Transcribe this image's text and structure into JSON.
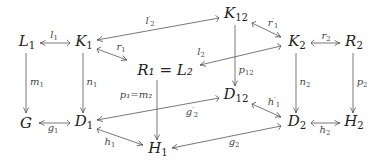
{
  "diagram": {
    "type": "commutative-diagram",
    "nodes": [
      {
        "id": "L1",
        "base": "L",
        "sub": "1",
        "x": 27,
        "y": 43
      },
      {
        "id": "K1",
        "base": "K",
        "sub": "1",
        "x": 83,
        "y": 43
      },
      {
        "id": "R1L2",
        "text": "R₁ = L₂",
        "x": 165,
        "y": 70
      },
      {
        "id": "K12",
        "base": "K",
        "sub": "12",
        "x": 235,
        "y": 15
      },
      {
        "id": "K2",
        "base": "K",
        "sub": "2",
        "x": 296,
        "y": 43
      },
      {
        "id": "R2",
        "base": "R",
        "sub": "2",
        "x": 353,
        "y": 43
      },
      {
        "id": "G",
        "base": "G",
        "sub": "",
        "x": 26,
        "y": 123
      },
      {
        "id": "D1",
        "base": "D",
        "sub": "1",
        "x": 83,
        "y": 123
      },
      {
        "id": "D12",
        "base": "D",
        "sub": "12",
        "x": 235,
        "y": 96
      },
      {
        "id": "D2",
        "base": "D",
        "sub": "2",
        "x": 296,
        "y": 123
      },
      {
        "id": "H2",
        "base": "H",
        "sub": "2",
        "x": 353,
        "y": 123
      },
      {
        "id": "H1",
        "base": "H",
        "sub": "1",
        "x": 158,
        "y": 150
      }
    ],
    "labels": {
      "l1": {
        "base": "l",
        "sub": "1",
        "prime": ""
      },
      "r1": {
        "base": "r",
        "sub": "1",
        "prime": ""
      },
      "l2p": {
        "base": "l",
        "sub": "2",
        "prime": "′"
      },
      "r1p": {
        "base": "r",
        "sub": "1",
        "prime": "′"
      },
      "l2": {
        "base": "l",
        "sub": "2",
        "prime": ""
      },
      "r2": {
        "base": "r",
        "sub": "2",
        "prime": ""
      },
      "m1": {
        "base": "m",
        "sub": "1",
        "prime": ""
      },
      "n1": {
        "base": "n",
        "sub": "1",
        "prime": ""
      },
      "p12": {
        "base": "p",
        "sub": "12",
        "prime": ""
      },
      "n2": {
        "base": "n",
        "sub": "2",
        "prime": ""
      },
      "p2": {
        "base": "p",
        "sub": "2",
        "prime": ""
      },
      "p1m2": {
        "text": "p₁=m₂"
      },
      "g1": {
        "base": "g",
        "sub": "1",
        "prime": ""
      },
      "g2p": {
        "base": "g",
        "sub": "2",
        "prime": "′"
      },
      "h1p": {
        "base": "h",
        "sub": "1",
        "prime": "′"
      },
      "h2": {
        "base": "h",
        "sub": "2",
        "prime": ""
      },
      "h1": {
        "base": "h",
        "sub": "1",
        "prime": ""
      },
      "g2": {
        "base": "g",
        "sub": "2",
        "prime": ""
      }
    },
    "node_text": {
      "L1": {
        "base": "L",
        "sub": "1"
      },
      "K1": {
        "base": "K",
        "sub": "1"
      },
      "R1L2": {
        "text": "R₁ = L₂"
      },
      "K12": {
        "base": "K",
        "sub": "12"
      },
      "K2": {
        "base": "K",
        "sub": "2"
      },
      "R2": {
        "base": "R",
        "sub": "2"
      },
      "G": {
        "base": "G",
        "sub": ""
      },
      "D1": {
        "base": "D",
        "sub": "1"
      },
      "D12": {
        "base": "D",
        "sub": "12"
      },
      "D2": {
        "base": "D",
        "sub": "2"
      },
      "H2": {
        "base": "H",
        "sub": "2"
      },
      "H1": {
        "base": "H",
        "sub": "1"
      }
    },
    "edges": [
      {
        "from": "K1",
        "to": "L1",
        "label": "l1",
        "style": "mono"
      },
      {
        "from": "K1",
        "to": "R1L2",
        "label": "r1",
        "style": "mono"
      },
      {
        "from": "K12",
        "to": "K1",
        "label": "l2p",
        "style": "mono"
      },
      {
        "from": "K12",
        "to": "K2",
        "label": "r1p",
        "style": "mono"
      },
      {
        "from": "K2",
        "to": "R1L2",
        "label": "l2",
        "style": "mono"
      },
      {
        "from": "K2",
        "to": "R2",
        "label": "r2",
        "style": "mono"
      },
      {
        "from": "L1",
        "to": "G",
        "label": "m1",
        "style": "plain"
      },
      {
        "from": "K1",
        "to": "D1",
        "label": "n1",
        "style": "plain"
      },
      {
        "from": "K12",
        "to": "D12",
        "label": "p12",
        "style": "plain"
      },
      {
        "from": "K2",
        "to": "D2",
        "label": "n2",
        "style": "plain"
      },
      {
        "from": "R2",
        "to": "H2",
        "label": "p2",
        "style": "plain"
      },
      {
        "from": "R1L2",
        "to": "H1",
        "label": "p1m2",
        "style": "plain"
      },
      {
        "from": "D1",
        "to": "G",
        "label": "g1",
        "style": "mono"
      },
      {
        "from": "D12",
        "to": "D1",
        "label": "g2p",
        "style": "mono"
      },
      {
        "from": "D12",
        "to": "D2",
        "label": "h1p",
        "style": "mono"
      },
      {
        "from": "D2",
        "to": "H2",
        "label": "h2",
        "style": "mono"
      },
      {
        "from": "D1",
        "to": "H1",
        "label": "h1",
        "style": "mono"
      },
      {
        "from": "D2",
        "to": "H1",
        "label": "g2",
        "style": "mono"
      }
    ]
  }
}
